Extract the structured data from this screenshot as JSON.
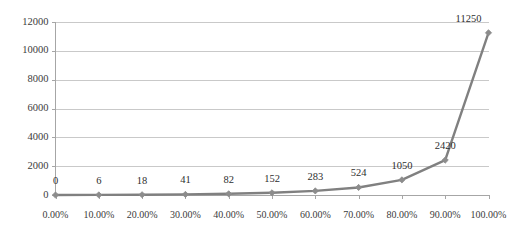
{
  "chart_data": {
    "type": "line",
    "title": "",
    "subtitle": "",
    "xlabel": "",
    "ylabel": "",
    "categories": [
      "0.00%",
      "10.00%",
      "20.00%",
      "30.00%",
      "40.00%",
      "50.00%",
      "60.00%",
      "70.00%",
      "80.00%",
      "90.00%",
      "100.00%"
    ],
    "x": [
      0,
      10,
      20,
      30,
      40,
      50,
      60,
      70,
      80,
      90,
      100
    ],
    "values": [
      0,
      6,
      18,
      41,
      82,
      152,
      283,
      524,
      1050,
      2420,
      11250
    ],
    "data_labels": [
      "0",
      "6",
      "18",
      "41",
      "82",
      "152",
      "283",
      "524",
      "1050",
      "2420",
      "11250"
    ],
    "series": [
      {
        "name": "Series 1",
        "values": [
          0,
          6,
          18,
          41,
          82,
          152,
          283,
          524,
          1050,
          2420,
          11250
        ]
      }
    ],
    "ylim": [
      0,
      12000
    ],
    "xlim": [
      0,
      100
    ],
    "yticks": [
      0,
      2000,
      4000,
      6000,
      8000,
      10000,
      12000
    ],
    "ytick_labels": [
      "0",
      "2000",
      "4000",
      "6000",
      "8000",
      "10000",
      "12000"
    ],
    "xtick_labels": [
      "0.00%",
      "10.00%",
      "20.00%",
      "30.00%",
      "40.00%",
      "50.00%",
      "60.00%",
      "70.00%",
      "80.00%",
      "90.00%",
      "100.00%"
    ],
    "grid": "horizontal",
    "legend": "none",
    "marker": "diamond",
    "colors": {
      "line": "#808080",
      "marker": "#8c8c8c",
      "gridline": "#c9c9c9",
      "axis": "#a6a6a6",
      "text": "#3b3b3b",
      "background": "#ffffff"
    }
  }
}
